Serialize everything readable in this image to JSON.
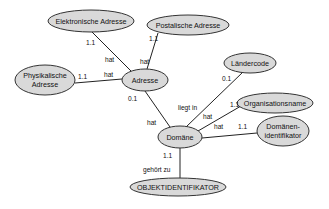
{
  "diagram": {
    "type": "entity-relationship",
    "colors": {
      "ellipse_fill": "#d9d9d9",
      "ellipse_stroke": "#333333",
      "line": "#222222",
      "background": "#ffffff"
    },
    "nodes": [
      {
        "id": "elektronische_adresse",
        "lines": [
          "Elektronische Adresse"
        ],
        "cx": 91,
        "cy": 21,
        "rx": 43,
        "ry": 11
      },
      {
        "id": "postalische_adresse",
        "lines": [
          "Postalische Adresse"
        ],
        "cx": 188,
        "cy": 25,
        "rx": 41,
        "ry": 10
      },
      {
        "id": "physikalische_adresse",
        "lines": [
          "Physikalische",
          "Adresse"
        ],
        "cx": 45,
        "cy": 80,
        "rx": 30,
        "ry": 15
      },
      {
        "id": "adresse",
        "lines": [
          "Adresse"
        ],
        "cx": 145,
        "cy": 80,
        "rx": 23,
        "ry": 11
      },
      {
        "id": "laendercode",
        "lines": [
          "Ländercode"
        ],
        "cx": 250,
        "cy": 63,
        "rx": 26,
        "ry": 10
      },
      {
        "id": "organisationsname",
        "lines": [
          "Organisationsname"
        ],
        "cx": 275,
        "cy": 103,
        "rx": 38,
        "ry": 10
      },
      {
        "id": "domaene",
        "lines": [
          "Domäne"
        ],
        "cx": 180,
        "cy": 137,
        "rx": 22,
        "ry": 11
      },
      {
        "id": "domaenenidentifikator",
        "lines": [
          "Domänen-",
          "identifikator"
        ],
        "cx": 283,
        "cy": 131,
        "rx": 26,
        "ry": 15
      },
      {
        "id": "objektidentifikator",
        "lines": [
          "OBJEKTIDENTIFIKATOR"
        ],
        "cx": 178,
        "cy": 187,
        "rx": 48,
        "ry": 9
      }
    ],
    "edges": [
      {
        "from": "adresse",
        "to": "elektronische_adresse",
        "x1": 131,
        "y1": 71,
        "x2": 92,
        "y2": 32
      },
      {
        "from": "adresse",
        "to": "postalische_adresse",
        "x1": 147,
        "y1": 69,
        "x2": 158,
        "y2": 33
      },
      {
        "from": "adresse",
        "to": "physikalische_adresse",
        "x1": 122,
        "y1": 79,
        "x2": 75,
        "y2": 83
      },
      {
        "from": "adresse",
        "to": "domaene",
        "x1": 145,
        "y1": 91,
        "x2": 170,
        "y2": 127
      },
      {
        "from": "domaene",
        "to": "laendercode",
        "x1": 186,
        "y1": 127,
        "x2": 243,
        "y2": 72
      },
      {
        "from": "domaene",
        "to": "organisationsname",
        "x1": 198,
        "y1": 131,
        "x2": 241,
        "y2": 106
      },
      {
        "from": "domaene",
        "to": "domaenenidentifikator",
        "x1": 202,
        "y1": 138,
        "x2": 257,
        "y2": 133
      },
      {
        "from": "domaene",
        "to": "objektidentifikator",
        "x1": 180,
        "y1": 148,
        "x2": 180,
        "y2": 178
      }
    ],
    "edge_labels": [
      {
        "text": "1.1",
        "x": 86,
        "y": 45
      },
      {
        "text": "hat",
        "x": 105,
        "y": 62
      },
      {
        "text": "1.1",
        "x": 149,
        "y": 41
      },
      {
        "text": "hat",
        "x": 140,
        "y": 64
      },
      {
        "text": "1.1",
        "x": 78,
        "y": 79
      },
      {
        "text": "hat",
        "x": 104,
        "y": 77
      },
      {
        "text": "0.1",
        "x": 128,
        "y": 101
      },
      {
        "text": "hat",
        "x": 147,
        "y": 125
      },
      {
        "text": "0.1",
        "x": 222,
        "y": 81
      },
      {
        "text": "liegt in",
        "x": 178,
        "y": 110
      },
      {
        "text": "1.1",
        "x": 230,
        "y": 107
      },
      {
        "text": "hat",
        "x": 203,
        "y": 119
      },
      {
        "text": "hat",
        "x": 214,
        "y": 129
      },
      {
        "text": "1.1",
        "x": 238,
        "y": 129
      },
      {
        "text": "1.1",
        "x": 163,
        "y": 158
      },
      {
        "text": "gehört zu",
        "x": 143,
        "y": 172
      }
    ]
  }
}
